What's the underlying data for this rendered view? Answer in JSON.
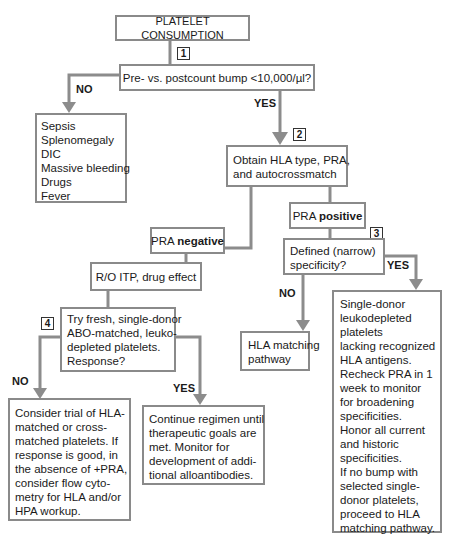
{
  "colors": {
    "connector": "#8c8c8c",
    "box_border": "#8a8a8a",
    "text": "#1a1a1a"
  },
  "nodes": {
    "start": {
      "text": "PLATELET CONSUMPTION"
    },
    "q1": {
      "text": "Pre- vs. postcount bump <10,000/µl?"
    },
    "causes": {
      "lines": [
        "Sepsis",
        "Splenomegaly",
        "DIC",
        "Massive bleeding",
        "Drugs",
        "Fever"
      ]
    },
    "obtain": {
      "lines": [
        "Obtain HLA type, PRA,",
        "and autocrossmatch"
      ]
    },
    "pra_positive": {
      "prefix": "PRA ",
      "bold": "positive"
    },
    "pra_negative": {
      "prefix": "PRA ",
      "bold": "negative"
    },
    "defined": {
      "lines": [
        "Defined (narrow)",
        "specificity?"
      ]
    },
    "rule_out": {
      "text": "R/O ITP, drug effect"
    },
    "try_fresh": {
      "lines": [
        "Try fresh, single-donor",
        "ABO-matched, leuko-",
        "depleted platelets.",
        "Response?"
      ]
    },
    "hla_matching": {
      "lines": [
        "HLA matching",
        "pathway"
      ]
    },
    "single_donor": {
      "lines": [
        "Single-donor",
        "leukodepleted",
        "platelets",
        "lacking recognized",
        "HLA antigens.",
        "Recheck PRA in 1",
        "week to monitor",
        "for broadening",
        "specificities.",
        "Honor all current",
        "and historic",
        "specificities.",
        "If no bump with",
        "selected single-",
        "donor platelets,",
        "proceed to HLA",
        "matching pathway."
      ]
    },
    "consider": {
      "lines": [
        "Consider trial of HLA-",
        "matched or cross-",
        "matched platelets.  If",
        "response is good, in",
        "the absence of +PRA,",
        "consider flow cyto-",
        "metry for HLA and/or",
        "HPA workup."
      ]
    },
    "continue": {
      "lines": [
        "Continue regimen until",
        "therapeutic goals are",
        "met.  Monitor for",
        "development of addi-",
        "tional alloantibodies."
      ]
    }
  },
  "step_numbers": {
    "s1": "1",
    "s2": "2",
    "s3": "3",
    "s4": "4"
  },
  "edge_labels": {
    "q1_no": "NO",
    "q1_yes": "YES",
    "defined_yes": "YES",
    "defined_no": "NO",
    "try_no": "NO",
    "try_yes": "YES"
  }
}
